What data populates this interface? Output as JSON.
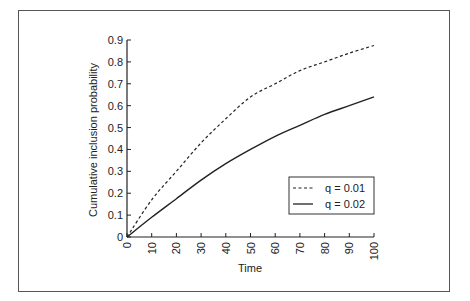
{
  "chart_data": {
    "type": "line",
    "title": "",
    "xlabel": "Time",
    "ylabel": "Cumulative inclusion probability",
    "xlim": [
      0,
      100
    ],
    "ylim": [
      0,
      0.9
    ],
    "x_ticks": [
      "0",
      "10",
      "20",
      "30",
      "40",
      "50",
      "60",
      "70",
      "80",
      "90",
      "100"
    ],
    "y_ticks": [
      "0",
      "0.1",
      "0.2",
      "0.3",
      "0.4",
      "0.5",
      "0.6",
      "0.7",
      "0.8",
      "0.9"
    ],
    "grid": false,
    "legend_position": "lower right (inside)",
    "x": [
      0,
      10,
      20,
      30,
      40,
      50,
      60,
      70,
      80,
      90,
      100
    ],
    "series": [
      {
        "name": "q=0.01",
        "style": "dashed",
        "values": [
          0,
          0.17,
          0.3,
          0.43,
          0.54,
          0.64,
          0.7,
          0.76,
          0.8,
          0.84,
          0.875
        ]
      },
      {
        "name": "q=0.02",
        "style": "solid",
        "values": [
          0,
          0.09,
          0.175,
          0.26,
          0.335,
          0.4,
          0.46,
          0.51,
          0.56,
          0.6,
          0.64
        ]
      }
    ]
  },
  "legend": {
    "items": [
      {
        "label": "q = 0.01"
      },
      {
        "label": "q = 0.02"
      }
    ]
  },
  "axes": {
    "xlabel": "Time",
    "ylabel": "Cumulative inclusion probability"
  }
}
